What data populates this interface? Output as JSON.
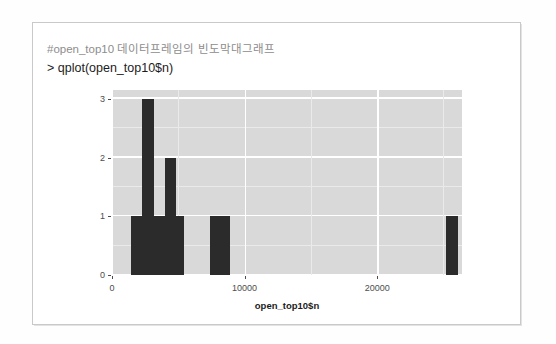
{
  "card": {
    "comment_line": "#open_top10 데이터프레임의 빈도막대그래프",
    "command_line": "> qplot(open_top10$n)"
  },
  "chart_data": {
    "type": "bar",
    "title": "",
    "subtitle": "",
    "xlabel": "open_top10$n",
    "ylabel": "",
    "xlim": [
      0,
      26400
    ],
    "ylim": [
      0,
      3.15
    ],
    "xticks": [
      0,
      10000,
      20000
    ],
    "xtick_labels": [
      "0",
      "10000",
      "20000"
    ],
    "yticks": [
      0,
      1,
      2,
      3
    ],
    "ytick_labels": [
      "0",
      "1",
      "2",
      "3"
    ],
    "grid": true,
    "legend": "none",
    "bar_color": "#2b2b2b",
    "panel_color": "#d9d9d9",
    "note": "ggplot2 qplot histogram of open_top10$n (frequency bar chart)",
    "bins": [
      {
        "x0": 1450,
        "x1": 2300,
        "value": 1
      },
      {
        "x0": 2300,
        "x1": 3150,
        "value": 3
      },
      {
        "x0": 3150,
        "x1": 4000,
        "value": 1
      },
      {
        "x0": 4000,
        "x1": 4850,
        "value": 2
      },
      {
        "x0": 4850,
        "x1": 5400,
        "value": 1
      },
      {
        "x0": 7400,
        "x1": 8900,
        "value": 1
      },
      {
        "x0": 25200,
        "x1": 26100,
        "value": 1
      }
    ],
    "categories": [
      "1450-2300",
      "2300-3150",
      "3150-4000",
      "4000-4850",
      "4850-5400",
      "7400-8900",
      "25200-26100"
    ],
    "values": [
      1,
      3,
      1,
      2,
      1,
      1,
      1
    ]
  }
}
